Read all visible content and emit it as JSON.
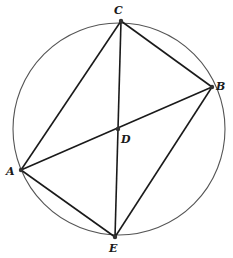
{
  "diagram": {
    "circle": {
      "cx": 119,
      "cy": 129,
      "r": 106
    },
    "points": {
      "A": {
        "x": 21,
        "y": 170,
        "label": "A",
        "lx": 6,
        "ly": 175
      },
      "B": {
        "x": 212,
        "y": 87,
        "label": "B",
        "lx": 216,
        "ly": 89
      },
      "C": {
        "x": 121,
        "y": 21,
        "label": "C",
        "lx": 114,
        "ly": 14
      },
      "D": {
        "x": 118,
        "y": 129,
        "label": "D",
        "lx": 122,
        "ly": 143
      },
      "E": {
        "x": 115,
        "y": 237,
        "label": "E",
        "lx": 109,
        "ly": 251
      }
    },
    "segments": [
      [
        "A",
        "C"
      ],
      [
        "C",
        "B"
      ],
      [
        "B",
        "E"
      ],
      [
        "E",
        "A"
      ],
      [
        "C",
        "E"
      ],
      [
        "A",
        "B"
      ]
    ],
    "colors": {
      "circle": "#555555",
      "lines": "#1a1a1a",
      "points": "#333333"
    }
  }
}
